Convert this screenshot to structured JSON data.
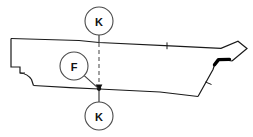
{
  "drawing": {
    "title": "Sectioned side-elevation technical drawing",
    "background_color": "#ffffff",
    "line_color": "#1a1a1a",
    "accent_color": "#000000",
    "section_line_color": "#6f6f6f",
    "width": 253,
    "height": 137
  },
  "callouts": {
    "section_top": {
      "label": "K",
      "cx": 99,
      "cy": 21,
      "r": 14
    },
    "detail_bubble": {
      "label": "F",
      "cx": 74,
      "cy": 66,
      "r": 14
    },
    "section_bottom": {
      "label": "K",
      "cx": 99,
      "cy": 116,
      "r": 14
    }
  },
  "section_line": {
    "name": "section-cut-K-K",
    "x": 99,
    "top_y": 35,
    "bottom_y": 102,
    "style": "dashed"
  },
  "leader": {
    "from_x": 85,
    "from_y": 76,
    "to_x": 99,
    "to_y": 89
  },
  "annotations": {
    "thick_feature_label": "thick-edge-feature",
    "tick_top_label": "top-edge-tick",
    "tick_diagonal_label": "diagonal-edge-tick"
  },
  "geometry": {
    "body_outline": "M 11 37 L 11 68 L 20 68 L 20 74 L 27 74 L 238 74 L 238 37 Z",
    "notes": "Elongated wing/panel profile with stepped left notch, pointed right tip and thick bent edge feature."
  }
}
